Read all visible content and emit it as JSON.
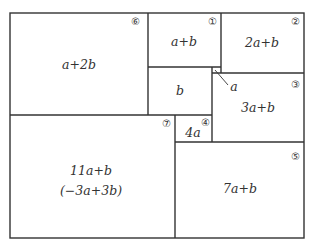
{
  "diagram": {
    "type": "rectangle-partition",
    "regions": [
      {
        "id": "6",
        "marker": "⑥",
        "label": "a+2b"
      },
      {
        "id": "1",
        "marker": "①",
        "label": "a+b"
      },
      {
        "id": "2",
        "marker": "②",
        "label": "2a+b"
      },
      {
        "id": "b",
        "marker": "",
        "label": "b"
      },
      {
        "id": "3",
        "marker": "③",
        "label": "3a+b"
      },
      {
        "id": "4",
        "marker": "④",
        "label": "4a"
      },
      {
        "id": "7",
        "marker": "⑦",
        "label": "11a+b",
        "sublabel": "(−3a+3b)"
      },
      {
        "id": "5",
        "marker": "⑤",
        "label": "7a+b"
      }
    ],
    "small_square_label": "a"
  }
}
